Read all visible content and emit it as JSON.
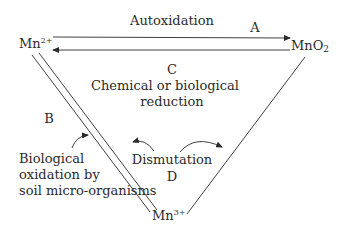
{
  "diagram": {
    "nodes": {
      "mn2": {
        "base": "Mn",
        "sup": "2+"
      },
      "mno2": {
        "base": "MnO",
        "sub": "2"
      },
      "mn3": {
        "base": "Mn",
        "sup": "3+"
      }
    },
    "edges": {
      "A": {
        "letter": "A",
        "label": "Autoxidation"
      },
      "B": {
        "letter": "B",
        "label_lines": [
          "Biological",
          "oxidation by",
          "soil micro-organisms"
        ]
      },
      "C": {
        "letter": "C",
        "label_lines": [
          "Chemical or biological",
          "reduction"
        ]
      },
      "D": {
        "letter": "D",
        "label": "Dismutation"
      }
    },
    "colors": {
      "line": "#2a2a2a",
      "text": "#2a2a2a",
      "background": "#ffffff"
    }
  }
}
